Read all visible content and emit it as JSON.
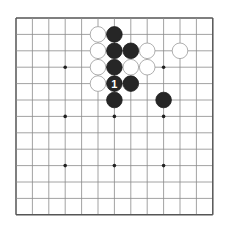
{
  "board": {
    "size": 13,
    "origin_x": 16,
    "origin_y": 18,
    "spacing": 16.4,
    "line_color": "#8a8a8a",
    "border_color": "#555555",
    "star_points": [
      [
        3,
        3
      ],
      [
        6,
        3
      ],
      [
        9,
        3
      ],
      [
        3,
        6
      ],
      [
        6,
        6
      ],
      [
        9,
        6
      ],
      [
        3,
        9
      ],
      [
        6,
        9
      ],
      [
        9,
        9
      ]
    ],
    "stones": [
      {
        "color": "white",
        "col": 5,
        "row": 1
      },
      {
        "color": "white",
        "col": 5,
        "row": 2
      },
      {
        "color": "white",
        "col": 5,
        "row": 3
      },
      {
        "color": "white",
        "col": 5,
        "row": 4
      },
      {
        "color": "black",
        "col": 6,
        "row": 1
      },
      {
        "color": "black",
        "col": 6,
        "row": 2
      },
      {
        "color": "black",
        "col": 6,
        "row": 3
      },
      {
        "color": "black",
        "col": 6,
        "row": 4,
        "label": "1"
      },
      {
        "color": "black",
        "col": 6,
        "row": 5
      },
      {
        "color": "black",
        "col": 7,
        "row": 2
      },
      {
        "color": "black",
        "col": 7,
        "row": 4
      },
      {
        "color": "white",
        "col": 7,
        "row": 3
      },
      {
        "color": "white",
        "col": 8,
        "row": 2
      },
      {
        "color": "white",
        "col": 8,
        "row": 3
      },
      {
        "color": "white",
        "col": 10,
        "row": 2
      },
      {
        "color": "black",
        "col": 9,
        "row": 5
      }
    ]
  }
}
